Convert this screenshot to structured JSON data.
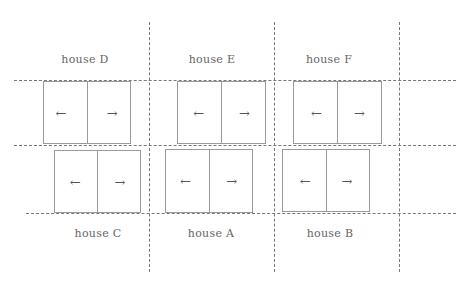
{
  "diagram": {
    "type": "floor-layout",
    "grid": {
      "vertical_lines_x": [
        149,
        274,
        399
      ],
      "horizontal_lines_y": [
        80,
        145,
        213
      ],
      "line_style": "dashed",
      "line_color": "#777777"
    },
    "houses": [
      {
        "id": "D",
        "label": "house D",
        "row": "top",
        "label_pos": "above",
        "label_x": 85,
        "label_y": 55,
        "box": {
          "x": 43,
          "y": 81,
          "w": 86,
          "h": 61
        },
        "left_arrow": "←",
        "right_arrow": "→"
      },
      {
        "id": "E",
        "label": "house E",
        "row": "top",
        "label_pos": "above",
        "label_x": 212,
        "label_y": 55,
        "box": {
          "x": 177,
          "y": 81,
          "w": 87,
          "h": 61
        },
        "left_arrow": "←",
        "right_arrow": "→"
      },
      {
        "id": "F",
        "label": "house F",
        "row": "top",
        "label_pos": "above",
        "label_x": 329,
        "label_y": 55,
        "box": {
          "x": 293,
          "y": 81,
          "w": 87,
          "h": 61
        },
        "left_arrow": "←",
        "right_arrow": "→"
      },
      {
        "id": "C",
        "label": "house C",
        "row": "bottom",
        "label_pos": "below",
        "label_x": 98,
        "label_y": 229,
        "box": {
          "x": 54,
          "y": 150,
          "w": 85,
          "h": 61
        },
        "left_arrow": "←",
        "right_arrow": "→"
      },
      {
        "id": "A",
        "label": "house A",
        "row": "bottom",
        "label_pos": "below",
        "label_x": 211,
        "label_y": 229,
        "box": {
          "x": 165,
          "y": 149,
          "w": 86,
          "h": 62
        },
        "left_arrow": "←",
        "right_arrow": "→"
      },
      {
        "id": "B",
        "label": "house B",
        "row": "bottom",
        "label_pos": "below",
        "label_x": 330,
        "label_y": 229,
        "box": {
          "x": 282,
          "y": 149,
          "w": 86,
          "h": 61
        },
        "left_arrow": "←",
        "right_arrow": "→"
      }
    ]
  }
}
